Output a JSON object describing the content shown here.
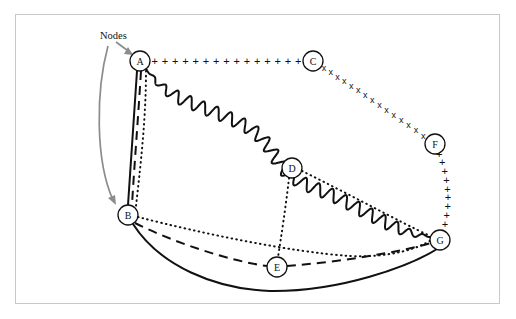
{
  "figure": {
    "title": "",
    "annotation": {
      "label": "Nodes",
      "x": 100,
      "y": 39
    },
    "frame": {
      "x": 15,
      "y": 14,
      "width": 485,
      "height": 290,
      "color": "#c9c9c9"
    },
    "background": "#ffffff",
    "ink_color": "#111111",
    "pointer_color": "#8c8c8c"
  },
  "chart_data": {
    "type": "diagram",
    "subtype": "node-link-graph",
    "title": "Nodes",
    "node_radius": 10,
    "nodes": [
      {
        "id": "A",
        "label": "A",
        "x": 140,
        "y": 61
      },
      {
        "id": "B",
        "label": "B",
        "x": 128,
        "y": 215
      },
      {
        "id": "C",
        "label": "C",
        "x": 313,
        "y": 61
      },
      {
        "id": "D",
        "label": "D",
        "x": 292,
        "y": 168
      },
      {
        "id": "E",
        "label": "E",
        "x": 277,
        "y": 267
      },
      {
        "id": "F",
        "label": "F",
        "x": 435,
        "y": 144
      },
      {
        "id": "G",
        "label": "G",
        "x": 440,
        "y": 240
      }
    ],
    "edges": [
      {
        "from": "A",
        "to": "B",
        "style": "solid",
        "name": "edge-a-b-solid"
      },
      {
        "from": "A",
        "to": "B",
        "style": "dashed",
        "name": "edge-a-b-dashed"
      },
      {
        "from": "A",
        "to": "B",
        "style": "dotted",
        "name": "edge-a-b-dotted"
      },
      {
        "from": "A",
        "to": "C",
        "style": "plus-marker",
        "name": "edge-a-c-plus"
      },
      {
        "from": "A",
        "to": "G",
        "style": "wavy",
        "name": "edge-a-g-wavy"
      },
      {
        "from": "C",
        "to": "F",
        "style": "cross-marker",
        "name": "edge-c-f-cross"
      },
      {
        "from": "F",
        "to": "G",
        "style": "plus-marker",
        "name": "edge-f-g-plus"
      },
      {
        "from": "B",
        "to": "G",
        "style": "dotted",
        "name": "edge-b-g-dotted"
      },
      {
        "from": "B",
        "to": "E",
        "style": "dashed",
        "name": "edge-b-e-dashed"
      },
      {
        "from": "E",
        "to": "G",
        "style": "dashed",
        "name": "edge-e-g-dashed"
      },
      {
        "from": "B",
        "to": "G",
        "style": "solid",
        "name": "edge-b-g-solid"
      },
      {
        "from": "D",
        "to": "E",
        "style": "dotted",
        "name": "edge-d-e-dotted"
      },
      {
        "from": "D",
        "to": "G",
        "style": "dotted",
        "name": "edge-d-g-dotted"
      }
    ],
    "markers": {
      "plus": "+",
      "cross": "x"
    },
    "legend": [],
    "xlabel": "",
    "ylabel": ""
  }
}
